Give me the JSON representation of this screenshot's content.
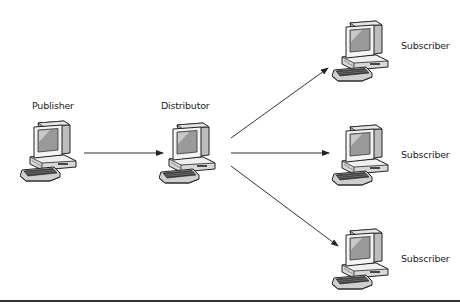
{
  "diagram": {
    "type": "publish-subscribe replication topology",
    "nodes": [
      {
        "id": "publisher",
        "label": "Publisher",
        "icon": "desktop-computer-icon"
      },
      {
        "id": "distributor",
        "label": "Distributor",
        "icon": "desktop-computer-icon"
      },
      {
        "id": "subscriber1",
        "label": "Subscriber",
        "icon": "desktop-computer-icon"
      },
      {
        "id": "subscriber2",
        "label": "Subscriber",
        "icon": "desktop-computer-icon"
      },
      {
        "id": "subscriber3",
        "label": "Subscriber",
        "icon": "desktop-computer-icon"
      }
    ],
    "edges": [
      {
        "from": "publisher",
        "to": "distributor",
        "style": "arrow"
      },
      {
        "from": "distributor",
        "to": "subscriber1",
        "style": "arrow"
      },
      {
        "from": "distributor",
        "to": "subscriber2",
        "style": "arrow"
      },
      {
        "from": "distributor",
        "to": "subscriber3",
        "style": "arrow"
      }
    ]
  },
  "colors": {
    "line": "#333333",
    "text": "#222222",
    "background": "#ffffff"
  }
}
